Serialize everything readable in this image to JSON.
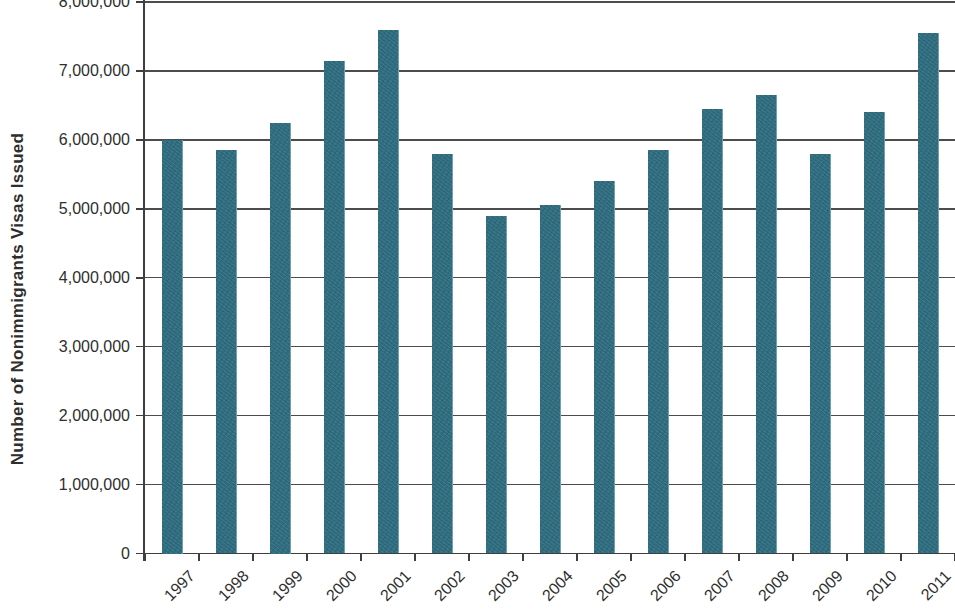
{
  "chart_data": {
    "type": "bar",
    "title": "",
    "xlabel": "",
    "ylabel": "Number of Nonimmigrants Visas Issued",
    "categories": [
      "1997",
      "1998",
      "1999",
      "2000",
      "2001",
      "2002",
      "2003",
      "2004",
      "2005",
      "2006",
      "2007",
      "2008",
      "2009",
      "2010",
      "2011"
    ],
    "values": [
      6000000,
      5850000,
      6250000,
      7150000,
      7600000,
      5800000,
      4900000,
      5050000,
      5400000,
      5850000,
      6450000,
      6650000,
      5800000,
      6400000,
      7550000
    ],
    "ylim": [
      0,
      8000000
    ],
    "ytick_interval": 1000000,
    "ytick_labels": [
      "0",
      "1,000,000",
      "2,000,000",
      "3,000,000",
      "4,000,000",
      "5,000,000",
      "6,000,000",
      "7,000,000",
      "8,000,000"
    ],
    "grid": true,
    "legend": false,
    "colors": {
      "bar_fill": "#2e6d7f",
      "axis": "#3f3f3f",
      "gridline": "#4c4c4c",
      "text": "#2e2e2e",
      "background": "#ffffff"
    }
  }
}
